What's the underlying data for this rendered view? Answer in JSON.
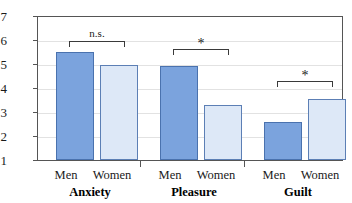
{
  "chart_data": {
    "type": "bar",
    "title": "",
    "xlabel": "",
    "ylabel": "",
    "ylim": [
      1,
      7
    ],
    "ytick_labels": [
      "7",
      "6",
      "5",
      "4",
      "3",
      "2",
      "1"
    ],
    "ytick_values": [
      7,
      6,
      5,
      4,
      3,
      2,
      1
    ],
    "grid": true,
    "legend_position": "none",
    "categories": [
      "Anxiety",
      "Pleasure",
      "Guilt"
    ],
    "series": [
      {
        "name": "Men",
        "values": [
          5.55,
          4.95,
          2.6
        ]
      },
      {
        "name": "Women",
        "values": [
          5.0,
          3.3,
          3.55
        ]
      }
    ],
    "group_sublabels": [
      "Men",
      "Women"
    ],
    "annotations": [
      {
        "category": "Anxiety",
        "text": "n.s."
      },
      {
        "category": "Pleasure",
        "text": "*"
      },
      {
        "category": "Guilt",
        "text": "*"
      }
    ],
    "colors": {
      "men_fill": "#7ba3dd",
      "men_border": "#4a72ae",
      "women_fill": "#dde8f7",
      "women_border": "#5c7fb5",
      "axis": "#555555",
      "gridline": "#e2e2e2"
    }
  }
}
